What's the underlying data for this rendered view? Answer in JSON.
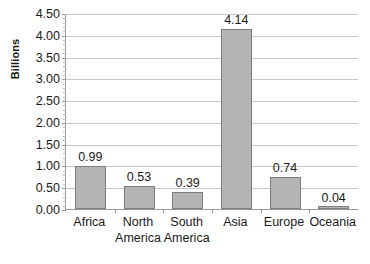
{
  "chart_data": {
    "type": "bar",
    "title": "",
    "xlabel": "",
    "ylabel": "Billions",
    "ylim": [
      0,
      4.5
    ],
    "ytick_step": 0.5,
    "grid": true,
    "legend": "none",
    "categories": [
      "Africa",
      "North America",
      "South America",
      "Asia",
      "Europe",
      "Oceania"
    ],
    "values": [
      0.99,
      0.53,
      0.39,
      4.14,
      0.74,
      0.04
    ],
    "value_labels": [
      "0.99",
      "0.53",
      "0.39",
      "4.14",
      "0.74",
      "0.04"
    ],
    "ytick_labels": [
      "0.00",
      "0.50",
      "1.00",
      "1.50",
      "2.00",
      "2.50",
      "3.00",
      "3.50",
      "4.00",
      "4.50"
    ],
    "ytick_values": [
      0,
      0.5,
      1,
      1.5,
      2,
      2.5,
      3,
      3.5,
      4,
      4.5
    ],
    "colors": {
      "bar_fill": "#b4b4b4",
      "bar_border": "#7d7d7d",
      "gridline": "#c8c8c8",
      "axis": "#9a9a9a",
      "text": "#1a1a1a",
      "background": "#ffffff"
    }
  }
}
